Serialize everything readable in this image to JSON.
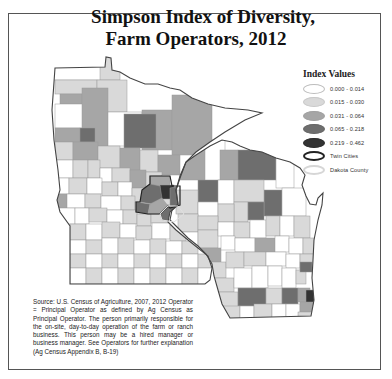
{
  "title": {
    "line1": "Simpson Index of Diversity,",
    "line2": "Farm Operators, 2012"
  },
  "legend": {
    "title": "Index Values",
    "items": [
      {
        "label": "0.000 - 0.014",
        "color": "#ffffff",
        "stroke": "#bdbdbd"
      },
      {
        "label": "0.015 - 0.030",
        "color": "#d9d9d9",
        "stroke": "#c8c8c8"
      },
      {
        "label": "0.031 - 0.064",
        "color": "#a6a6a6",
        "stroke": "#a0a0a0"
      },
      {
        "label": "0.065 - 0.218",
        "color": "#6e6e6e",
        "stroke": "#666666"
      },
      {
        "label": "0.219 - 0.462",
        "color": "#333333",
        "stroke": "#2a2a2a"
      },
      {
        "label": "Twin Cities",
        "color": "#ffffff",
        "stroke": "#222222"
      },
      {
        "label": "Dakota County",
        "color": "#ffffff",
        "stroke": "#d0d0d0"
      }
    ]
  },
  "source_note": "Source: U.S. Census of Agriculture, 2007, 2012 Operator = Principal Operator as defined by Ag Census as Principal Operator. The person primarily responsible for the on-site, day-to-day operation of the farm or ranch business. This person may be a hired manager or business manager. See Operators for further explanation (Ag Census Appendix B, B-19)",
  "map": {
    "states": [
      "Minnesota",
      "Wisconsin"
    ],
    "class_colors": {
      "c0": "#ffffff",
      "c1": "#d9d9d9",
      "c2": "#a6a6a6",
      "c3": "#6e6e6e",
      "c4": "#333333"
    }
  }
}
